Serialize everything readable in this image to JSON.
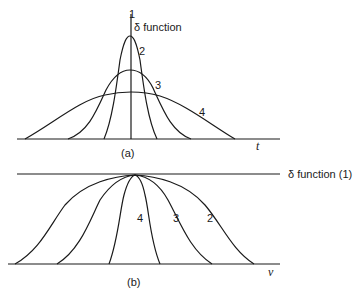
{
  "panel_a": {
    "label": "(a)",
    "axis_label": "t",
    "top_label_number": "1",
    "top_label_text": "δ function",
    "curve_labels": [
      "2",
      "3",
      "4"
    ]
  },
  "panel_b": {
    "label": "(b)",
    "axis_label": "ν",
    "top_label_text": "δ function (1)",
    "curve_labels": [
      "4",
      "3",
      "2"
    ]
  }
}
